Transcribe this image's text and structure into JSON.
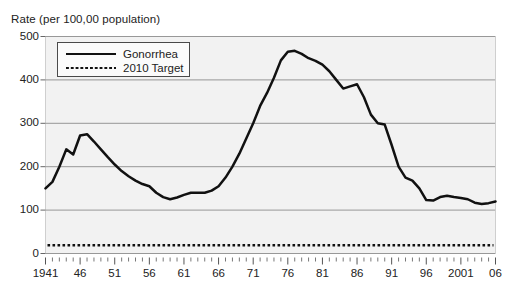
{
  "chart_data": {
    "type": "line",
    "title": "Rate (per 100,00 population)",
    "xlabel": "",
    "ylabel": "Rate (per 100,00 population)",
    "xlim": [
      1941,
      2006
    ],
    "ylim": [
      0,
      500
    ],
    "yticks": [
      0,
      100,
      200,
      300,
      400,
      500
    ],
    "xticks": [
      1941,
      1946,
      1951,
      1956,
      1961,
      1966,
      1971,
      1976,
      1981,
      1986,
      1991,
      1996,
      2001,
      2006
    ],
    "xticklabels": [
      "1941",
      "46",
      "51",
      "56",
      "61",
      "66",
      "71",
      "76",
      "81",
      "86",
      "91",
      "96",
      "2001",
      "06"
    ],
    "grid": "horizontal",
    "legend_position": "upper-left",
    "x": [
      1941,
      1942,
      1943,
      1944,
      1945,
      1946,
      1947,
      1948,
      1949,
      1950,
      1951,
      1952,
      1953,
      1954,
      1955,
      1956,
      1957,
      1958,
      1959,
      1960,
      1961,
      1962,
      1963,
      1964,
      1965,
      1966,
      1967,
      1968,
      1969,
      1970,
      1971,
      1972,
      1973,
      1974,
      1975,
      1976,
      1977,
      1978,
      1979,
      1980,
      1981,
      1982,
      1983,
      1984,
      1985,
      1986,
      1987,
      1988,
      1989,
      1990,
      1991,
      1992,
      1993,
      1994,
      1995,
      1996,
      1997,
      1998,
      1999,
      2000,
      2001,
      2002,
      2003,
      2004,
      2005,
      2006
    ],
    "series": [
      {
        "name": "Gonorrhea",
        "style": "solid",
        "color": "#111111",
        "values": [
          150,
          165,
          200,
          240,
          228,
          272,
          275,
          258,
          240,
          222,
          205,
          190,
          178,
          168,
          160,
          155,
          140,
          130,
          125,
          129,
          135,
          140,
          140,
          140,
          145,
          155,
          175,
          200,
          230,
          265,
          300,
          340,
          370,
          405,
          445,
          465,
          467,
          460,
          450,
          444,
          435,
          420,
          400,
          380,
          385,
          390,
          360,
          320,
          300,
          297,
          250,
          200,
          175,
          168,
          150,
          123,
          122,
          130,
          133,
          130,
          128,
          125,
          117,
          114,
          116,
          120
        ]
      },
      {
        "name": "2010 Target",
        "style": "dotted",
        "color": "#111111",
        "constant_value": 19
      }
    ],
    "legend": [
      {
        "label": "Gonorrhea",
        "style": "solid"
      },
      {
        "label": "2010 Target",
        "style": "dotted"
      }
    ]
  }
}
